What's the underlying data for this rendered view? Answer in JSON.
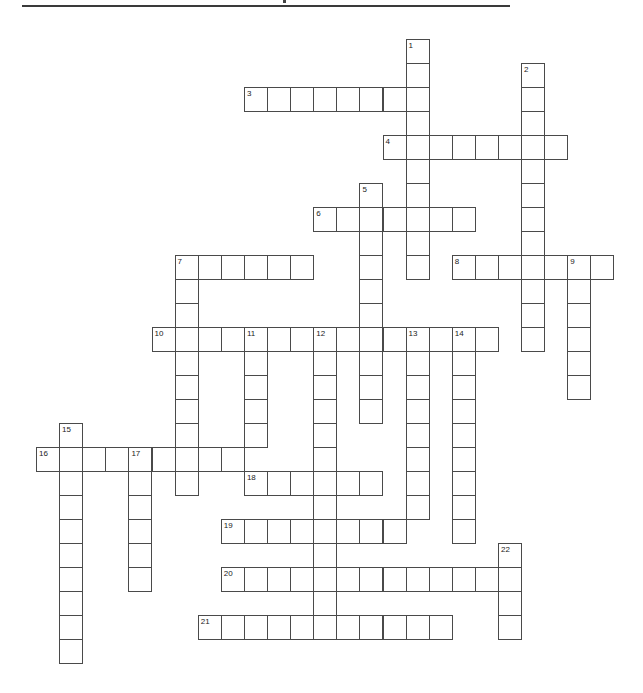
{
  "page": {
    "header_rule_color": "#3a3a3a",
    "cell_border_color": "#4a4a4a"
  },
  "grid": {
    "origin_x": 36,
    "origin_y": 39,
    "cell_w": 23.1,
    "cell_h": 24,
    "across": [
      {
        "num": "3",
        "row": 2,
        "col": 9,
        "len": 8
      },
      {
        "num": "4",
        "row": 4,
        "col": 15,
        "len": 8
      },
      {
        "num": "6",
        "row": 7,
        "col": 12,
        "len": 7
      },
      {
        "num": "7",
        "row": 9,
        "col": 6,
        "len": 6
      },
      {
        "num": "8",
        "row": 9,
        "col": 18,
        "len": 7
      },
      {
        "num": "10",
        "row": 12,
        "col": 5,
        "len": 15
      },
      {
        "num": "16",
        "row": 17,
        "col": 0,
        "len": 9
      },
      {
        "num": "18",
        "row": 18,
        "col": 9,
        "len": 6
      },
      {
        "num": "19",
        "row": 20,
        "col": 8,
        "len": 8
      },
      {
        "num": "20",
        "row": 22,
        "col": 8,
        "len": 13
      },
      {
        "num": "21",
        "row": 24,
        "col": 7,
        "len": 11
      }
    ],
    "down": [
      {
        "num": "1",
        "row": 0,
        "col": 16,
        "len": 10
      },
      {
        "num": "2",
        "row": 1,
        "col": 21,
        "len": 12
      },
      {
        "num": "5",
        "row": 6,
        "col": 14,
        "len": 10
      },
      {
        "num": "7",
        "row": 9,
        "col": 6,
        "len": 10
      },
      {
        "num": "9",
        "row": 9,
        "col": 23,
        "len": 6
      },
      {
        "num": "11",
        "row": 12,
        "col": 9,
        "len": 5
      },
      {
        "num": "12",
        "row": 12,
        "col": 12,
        "len": 13
      },
      {
        "num": "13",
        "row": 12,
        "col": 16,
        "len": 8
      },
      {
        "num": "14",
        "row": 12,
        "col": 18,
        "len": 9
      },
      {
        "num": "15",
        "row": 16,
        "col": 1,
        "len": 10
      },
      {
        "num": "17",
        "row": 17,
        "col": 4,
        "len": 6
      },
      {
        "num": "22",
        "row": 21,
        "col": 20,
        "len": 4
      }
    ]
  }
}
